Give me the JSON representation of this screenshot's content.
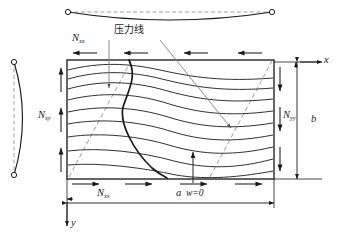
{
  "figure": {
    "title_label": "压力线",
    "nodal_label": "w=0",
    "axes": {
      "x": "x",
      "y": "y"
    },
    "dimensions": {
      "width": "a",
      "height": "b"
    },
    "forces": {
      "top": {
        "symbol": "N",
        "sub": "xx"
      },
      "bottom": {
        "symbol": "N",
        "sub": "xx"
      },
      "left": {
        "symbol": "N",
        "sub": "xy"
      },
      "right": {
        "symbol": "N",
        "sub": "yy"
      }
    },
    "colors": {
      "ink": "#1a1a1a",
      "contour": "#262626",
      "dashed": "#8c8c8c",
      "leader": "#7a7a7a",
      "plate_edge": "#333333"
    },
    "contour_count": 9,
    "edge_arrows": {
      "top_direction": "left",
      "bottom_direction": "right",
      "left_direction": "up",
      "right_direction": "down",
      "top_count": 4,
      "bottom_count": 4,
      "left_count": 3,
      "right_count": 3
    },
    "beams": {
      "top_beam_shape": "sagging",
      "left_beam_shape": "bowed-right",
      "end_marker": "pinned-circle"
    }
  },
  "caption": {
    "text": ""
  }
}
